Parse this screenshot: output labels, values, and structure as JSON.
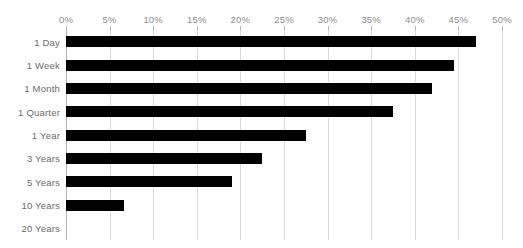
{
  "chart_data": {
    "type": "bar",
    "orientation": "horizontal",
    "title": "",
    "subtitle": "",
    "xlabel": "",
    "ylabel": "",
    "categories": [
      "1 Day",
      "1 Week",
      "1 Month",
      "1 Quarter",
      "1 Year",
      "3 Years",
      "5 Years",
      "10 Years",
      "20 Years"
    ],
    "values": [
      47.0,
      44.5,
      42.0,
      37.5,
      27.5,
      22.5,
      19.0,
      6.7,
      0.0
    ],
    "value_suffix": "%",
    "xlim": [
      0,
      50
    ],
    "xticks": [
      0,
      5,
      10,
      15,
      20,
      25,
      30,
      35,
      40,
      45,
      50
    ],
    "xtick_labels": [
      "0%",
      "5%",
      "10%",
      "15%",
      "20%",
      "25%",
      "30%",
      "35%",
      "40%",
      "45%",
      "50%"
    ],
    "grid": true,
    "grid_axis": "x",
    "legend": null,
    "legend_position": "none",
    "bar_color": "#000000",
    "grid_color": "#d9d9d9",
    "axis_color": "#b3b3b3",
    "tick_label_color": "#8c8c8c",
    "category_label_color": "#6b6b6b",
    "background_color": "#ffffff",
    "annotations": []
  }
}
